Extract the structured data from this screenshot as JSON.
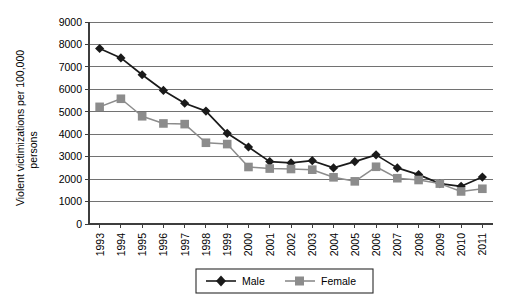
{
  "chart_data": {
    "type": "line",
    "title": "",
    "subtitle": "",
    "xlabel": "",
    "ylabel": "Violent victimizations per 100,000 persons",
    "x": [
      1993,
      1994,
      1995,
      1996,
      1997,
      1998,
      1999,
      2000,
      2001,
      2002,
      2003,
      2004,
      2005,
      2006,
      2007,
      2008,
      2009,
      2010,
      2011
    ],
    "categories": [
      "1993",
      "1994",
      "1995",
      "1996",
      "1997",
      "1998",
      "1999",
      "2000",
      "2001",
      "2002",
      "2003",
      "2004",
      "2005",
      "2006",
      "2007",
      "2008",
      "2009",
      "2010",
      "2011"
    ],
    "series": [
      {
        "name": "Male",
        "color": "#1a1a1a",
        "marker": "diamond",
        "values": [
          7820,
          7400,
          6650,
          5950,
          5380,
          5030,
          4040,
          3430,
          2780,
          2720,
          2820,
          2500,
          2780,
          3080,
          2500,
          2200,
          1800,
          1680,
          2090
        ]
      },
      {
        "name": "Female",
        "color": "#8c8c8c",
        "marker": "square",
        "values": [
          5220,
          5580,
          4800,
          4480,
          4450,
          3620,
          3560,
          2540,
          2470,
          2450,
          2420,
          2080,
          1900,
          2550,
          2040,
          1960,
          1800,
          1450,
          1570
        ]
      }
    ],
    "ylim": [
      0,
      9000
    ],
    "ytick_labels": [
      "9000",
      "8000",
      "7000",
      "6000",
      "5000",
      "4000",
      "3000",
      "2000",
      "1000",
      "0"
    ],
    "yticks": [
      9000,
      8000,
      7000,
      6000,
      5000,
      4000,
      3000,
      2000,
      1000,
      0
    ],
    "grid": true,
    "grid_axis": "y",
    "legend_position": "bottom-center",
    "legend_entries": [
      "Male",
      "Female"
    ]
  }
}
